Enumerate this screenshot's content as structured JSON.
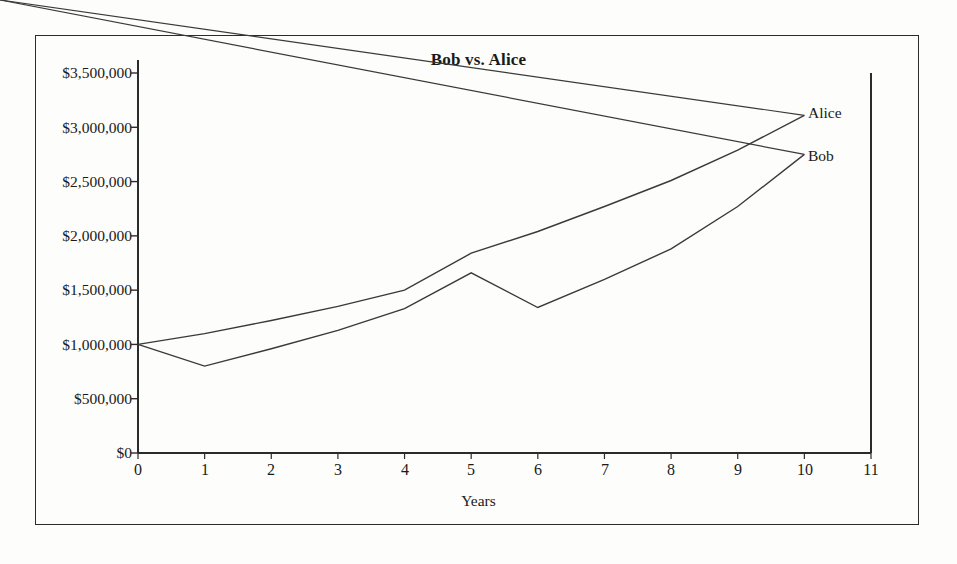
{
  "figure": {
    "frame_color": "#2b2b2b",
    "background": "#fdfdfb",
    "line_color": "#3a3a3a"
  },
  "chart_data": {
    "type": "line",
    "title": "Bob vs. Alice",
    "xlabel": "Years",
    "ylabel": "",
    "xlim": [
      0,
      11
    ],
    "ylim": [
      0,
      3500000
    ],
    "grid": false,
    "legend_position": "end-of-line labels (right)",
    "x": [
      0,
      1,
      2,
      3,
      4,
      5,
      6,
      7,
      8,
      9,
      10
    ],
    "xticks": [
      "0",
      "1",
      "2",
      "3",
      "4",
      "5",
      "6",
      "7",
      "8",
      "9",
      "10",
      "11"
    ],
    "yticks": [
      "$0",
      "$500,000",
      "$1,000,000",
      "$1,500,000",
      "$2,000,000",
      "$2,500,000",
      "$3,000,000",
      "$3,500,000"
    ],
    "ytick_values": [
      0,
      500000,
      1000000,
      1500000,
      2000000,
      2500000,
      3000000,
      3500000
    ],
    "series": [
      {
        "name": "Alice",
        "values": [
          1000000,
          1100000,
          1220000,
          1350000,
          1500000,
          1840000,
          2040000,
          2270000,
          2510000,
          2790000,
          3110000
        ]
      },
      {
        "name": "Bob",
        "values": [
          1000000,
          800000,
          960000,
          1130000,
          1330000,
          1660000,
          1340000,
          1600000,
          1880000,
          2270000,
          2750000
        ]
      }
    ]
  }
}
